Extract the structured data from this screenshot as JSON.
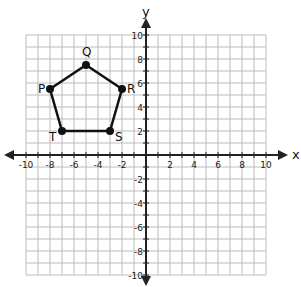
{
  "chart_data": {
    "type": "scatter",
    "title": "",
    "xlabel": "x",
    "ylabel": "y",
    "xlim": [
      -10,
      10
    ],
    "ylim": [
      -10,
      10
    ],
    "grid": true,
    "x_tick_labels": [
      "-10",
      "-8",
      "-6",
      "-4",
      "-2",
      "2",
      "4",
      "6",
      "8",
      "10"
    ],
    "y_tick_labels": [
      "10",
      "8",
      "6",
      "4",
      "2",
      "-2",
      "-4",
      "-6",
      "-8",
      "-10"
    ],
    "shape": "pentagon PQRST",
    "points": [
      {
        "label": "P",
        "x": -8,
        "y": 5.5
      },
      {
        "label": "Q",
        "x": -5,
        "y": 7.5
      },
      {
        "label": "R",
        "x": -2,
        "y": 5.5
      },
      {
        "label": "S",
        "x": -3,
        "y": 2
      },
      {
        "label": "T",
        "x": -7,
        "y": 2
      }
    ],
    "polygon_order": [
      "P",
      "Q",
      "R",
      "S",
      "T"
    ]
  },
  "colors": {
    "grid": "#bdbdbd",
    "axis": "#222222",
    "polygon": "#111111"
  }
}
